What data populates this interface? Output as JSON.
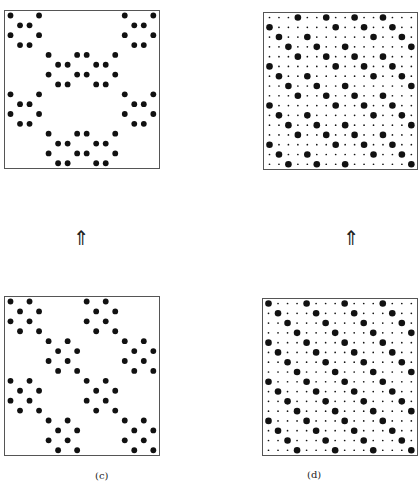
{
  "figure": {
    "grid_size": 16,
    "dot_color": "#111111",
    "panels": [
      {
        "id": "a",
        "label": "",
        "type": "sparse",
        "box": {
          "x": 4,
          "y": 10,
          "w": 156,
          "h": 159
        },
        "dots_by_row": [
          [
            0,
            3,
            12,
            15
          ],
          [
            1,
            2,
            13,
            14
          ],
          [
            0,
            3,
            12,
            15
          ],
          [
            1,
            2,
            13,
            14
          ],
          [
            4,
            7,
            8,
            11
          ],
          [
            5,
            6,
            9,
            10
          ],
          [
            4,
            7,
            8,
            11
          ],
          [
            5,
            6,
            9,
            10
          ],
          [
            0,
            3,
            12,
            15
          ],
          [
            1,
            2,
            13,
            14
          ],
          [
            0,
            3,
            12,
            15
          ],
          [
            1,
            2,
            13,
            14
          ],
          [
            4,
            7,
            8,
            11
          ],
          [
            5,
            6,
            9,
            10
          ],
          [
            4,
            7,
            8,
            11
          ],
          [
            5,
            6,
            9,
            10
          ]
        ]
      },
      {
        "id": "b",
        "label": "",
        "type": "dense",
        "box": {
          "x": 263,
          "y": 12,
          "w": 155,
          "h": 158
        },
        "big_by_row": [
          [
            3,
            6,
            9,
            12
          ],
          [
            0,
            7,
            10,
            13
          ],
          [
            1,
            4,
            11,
            14
          ],
          [
            2,
            5,
            8,
            15
          ],
          [
            3,
            6,
            9,
            12
          ],
          [
            0,
            7,
            10,
            13
          ],
          [
            1,
            4,
            11,
            14
          ],
          [
            2,
            5,
            8,
            15
          ],
          [
            3,
            6,
            9,
            12
          ],
          [
            0,
            7,
            10,
            13
          ],
          [
            1,
            4,
            11,
            14
          ],
          [
            2,
            5,
            8,
            15
          ],
          [
            3,
            6,
            9,
            12
          ],
          [
            0,
            7,
            10,
            13
          ],
          [
            1,
            4,
            11,
            14
          ],
          [
            2,
            5,
            8,
            15
          ]
        ]
      },
      {
        "id": "c",
        "label": "(c)",
        "type": "sparse",
        "box": {
          "x": 4,
          "y": 296,
          "w": 156,
          "h": 160
        },
        "dots_by_row": [
          [
            0,
            2,
            8,
            10
          ],
          [
            1,
            3,
            9,
            11
          ],
          [
            0,
            2,
            8,
            10
          ],
          [
            1,
            3,
            9,
            11
          ],
          [
            4,
            6,
            12,
            14
          ],
          [
            5,
            7,
            13,
            15
          ],
          [
            4,
            6,
            12,
            14
          ],
          [
            5,
            7,
            13,
            15
          ],
          [
            0,
            2,
            8,
            10
          ],
          [
            1,
            3,
            9,
            11
          ],
          [
            0,
            2,
            8,
            10
          ],
          [
            1,
            3,
            9,
            11
          ],
          [
            4,
            6,
            12,
            14
          ],
          [
            5,
            7,
            13,
            15
          ],
          [
            4,
            6,
            12,
            14
          ],
          [
            5,
            7,
            13,
            15
          ]
        ]
      },
      {
        "id": "d",
        "label": "(d)",
        "type": "dense",
        "box": {
          "x": 262,
          "y": 298,
          "w": 156,
          "h": 158
        },
        "big_by_row": [
          [
            0,
            4,
            8,
            12
          ],
          [
            1,
            5,
            9,
            13
          ],
          [
            2,
            6,
            10,
            14
          ],
          [
            3,
            7,
            11,
            15
          ],
          [
            0,
            4,
            8,
            12
          ],
          [
            1,
            5,
            9,
            13
          ],
          [
            2,
            6,
            10,
            14
          ],
          [
            3,
            7,
            11,
            15
          ],
          [
            0,
            4,
            8,
            12
          ],
          [
            1,
            5,
            9,
            13
          ],
          [
            2,
            6,
            10,
            14
          ],
          [
            3,
            7,
            11,
            15
          ],
          [
            0,
            4,
            8,
            12
          ],
          [
            1,
            5,
            9,
            13
          ],
          [
            2,
            6,
            10,
            14
          ],
          [
            3,
            7,
            11,
            15
          ]
        ]
      }
    ],
    "arrows": [
      {
        "glyph": "⇑",
        "x": 73,
        "y": 228
      },
      {
        "glyph": "⇑",
        "x": 343,
        "y": 228
      }
    ],
    "labels": {
      "c": "(c)",
      "d": "(d)"
    }
  }
}
